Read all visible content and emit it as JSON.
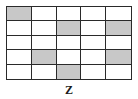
{
  "figure": {
    "label": "Z",
    "rows": 5,
    "cols": 5,
    "shaded_color": "#c8c8c8",
    "line_color": "#2a2a2a",
    "cells": [
      [
        1,
        0,
        0,
        0,
        0
      ],
      [
        0,
        0,
        1,
        0,
        1
      ],
      [
        0,
        0,
        0,
        0,
        0
      ],
      [
        0,
        1,
        0,
        0,
        1
      ],
      [
        0,
        0,
        1,
        0,
        0
      ]
    ]
  }
}
